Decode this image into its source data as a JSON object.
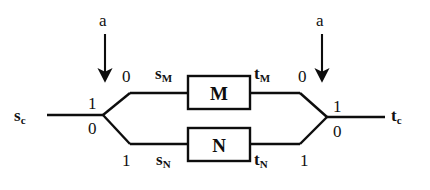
{
  "diagram": {
    "stroke_color": "#0d0d0d",
    "background_color": "#ffffff",
    "input_signal": {
      "base": "s",
      "subscript": "c"
    },
    "output_signal": {
      "base": "t",
      "subscript": "c"
    },
    "control_arrows": [
      {
        "label": "a",
        "position": "left"
      },
      {
        "label": "a",
        "position": "right"
      }
    ],
    "junctions": {
      "left": {
        "top_label": "1",
        "bottom_label": "0"
      },
      "right": {
        "top_label": "1",
        "bottom_label": "0"
      }
    },
    "branches": [
      {
        "name": "upper",
        "block_label": "M",
        "entry_digit": "0",
        "exit_digit": "0",
        "input_signal": {
          "base": "s",
          "subscript": "M"
        },
        "output_signal": {
          "base": "t",
          "subscript": "M"
        }
      },
      {
        "name": "lower",
        "block_label": "N",
        "entry_digit": "1",
        "exit_digit": "1",
        "input_signal": {
          "base": "s",
          "subscript": "N"
        },
        "output_signal": {
          "base": "t",
          "subscript": "N"
        }
      }
    ]
  }
}
